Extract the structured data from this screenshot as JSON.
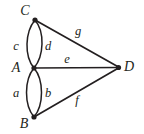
{
  "figure": {
    "type": "undirected-multigraph",
    "background_color": "#ffffff",
    "stroke_color": "#231f20",
    "vertices": [
      {
        "id": "C",
        "label": "C",
        "x": 35,
        "y": 20,
        "label_x": 25,
        "label_y": 11
      },
      {
        "id": "A",
        "label": "A",
        "x": 34,
        "y": 68,
        "label_x": 16,
        "label_y": 68
      },
      {
        "id": "B",
        "label": "B",
        "x": 34,
        "y": 117,
        "label_x": 24,
        "label_y": 124
      },
      {
        "id": "D",
        "label": "D",
        "x": 119,
        "y": 67,
        "label_x": 129,
        "label_y": 67
      }
    ],
    "edges": [
      {
        "id": "c",
        "label": "c",
        "from": "A",
        "to": "C",
        "shape": "curve-left",
        "label_x": 16,
        "label_y": 46
      },
      {
        "id": "d",
        "label": "d",
        "from": "A",
        "to": "C",
        "shape": "curve-right",
        "label_x": 48,
        "label_y": 46
      },
      {
        "id": "a",
        "label": "a",
        "from": "A",
        "to": "B",
        "shape": "curve-left",
        "label_x": 16,
        "label_y": 93
      },
      {
        "id": "b",
        "label": "b",
        "from": "A",
        "to": "B",
        "shape": "curve-right",
        "label_x": 48,
        "label_y": 93
      },
      {
        "id": "e",
        "label": "e",
        "from": "A",
        "to": "D",
        "shape": "straight",
        "label_x": 67,
        "label_y": 59
      },
      {
        "id": "g",
        "label": "g",
        "from": "C",
        "to": "D",
        "shape": "straight",
        "label_x": 78,
        "label_y": 31
      },
      {
        "id": "f",
        "label": "f",
        "from": "B",
        "to": "D",
        "shape": "straight",
        "label_x": 77,
        "label_y": 100
      }
    ]
  }
}
